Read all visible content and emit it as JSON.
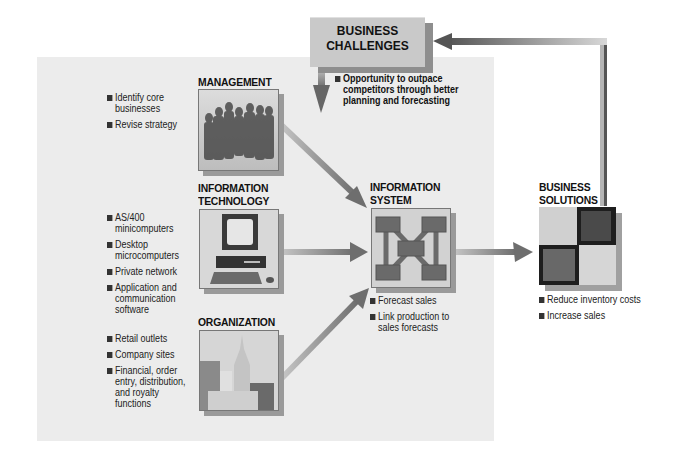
{
  "diagram": {
    "business_challenges": {
      "title_line1": "BUSINESS",
      "title_line2": "CHALLENGES",
      "bullets": [
        "Opportunity to outpace competitors through better planning and forecasting"
      ]
    },
    "management": {
      "title": "MANAGEMENT",
      "bullets": [
        "Identify core businesses",
        "Revise strategy"
      ],
      "image_icon": "people-group-image"
    },
    "technology": {
      "title_line1": "INFORMATION",
      "title_line2": "TECHNOLOGY",
      "bullets": [
        "AS/400 minicomputers",
        "Desktop microcomputers",
        "Private network",
        "Application and communication software"
      ],
      "image_icon": "desktop-computer-image"
    },
    "organization": {
      "title": "ORGANIZATION",
      "bullets": [
        "Retail  outlets",
        "Company sites",
        "Financial, order entry, distribution, and royalty functions"
      ],
      "image_icon": "city-buildings-image"
    },
    "information_system": {
      "title_line1": "INFORMATION",
      "title_line2": "SYSTEM",
      "bullets": [
        "Forecast sales",
        "Link production to sales forecasts"
      ],
      "image_icon": "network-nodes-image"
    },
    "business_solutions": {
      "title_line1": "BUSINESS",
      "title_line2": "SOLUTIONS",
      "bullets": [
        "Reduce inventory costs",
        "Increase sales"
      ],
      "image_icon": "checkerboard-image"
    }
  }
}
